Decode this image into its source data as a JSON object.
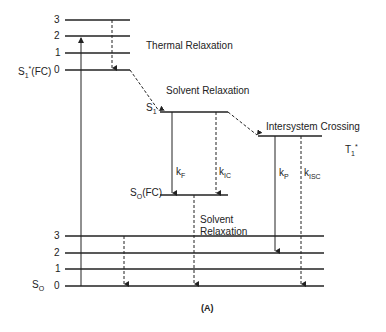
{
  "diagram": {
    "caption": "(A)",
    "excited_fc": {
      "state_label": "S",
      "state_sub": "1",
      "state_sup": "*",
      "state_suffix": "(FC)",
      "levels": [
        "3",
        "2",
        "1",
        "0"
      ]
    },
    "ground": {
      "state_label": "S",
      "state_sub": "O",
      "levels": [
        "3",
        "2",
        "1",
        "0"
      ]
    },
    "s1": {
      "label": "S",
      "sub": "1"
    },
    "s0_fc": {
      "label": "S",
      "sub": "O",
      "suffix": "(FC)"
    },
    "t1": {
      "label": "T",
      "sub": "1",
      "sup": "*"
    },
    "processes": {
      "thermal": "Thermal   Relaxation",
      "solvent1": "Solvent   Relaxation",
      "isc": "Intersystem   Crossing",
      "solvent2_line1": "Solvent",
      "solvent2_line2": "Relaxation"
    },
    "rates": {
      "kf": {
        "k": "k",
        "sub": "F"
      },
      "kic": {
        "k": "k",
        "sub": "IC"
      },
      "kp": {
        "k": "k",
        "sub": "P"
      },
      "kisc": {
        "k": "k",
        "sub": "ISC"
      }
    },
    "line_color": "#222222"
  }
}
